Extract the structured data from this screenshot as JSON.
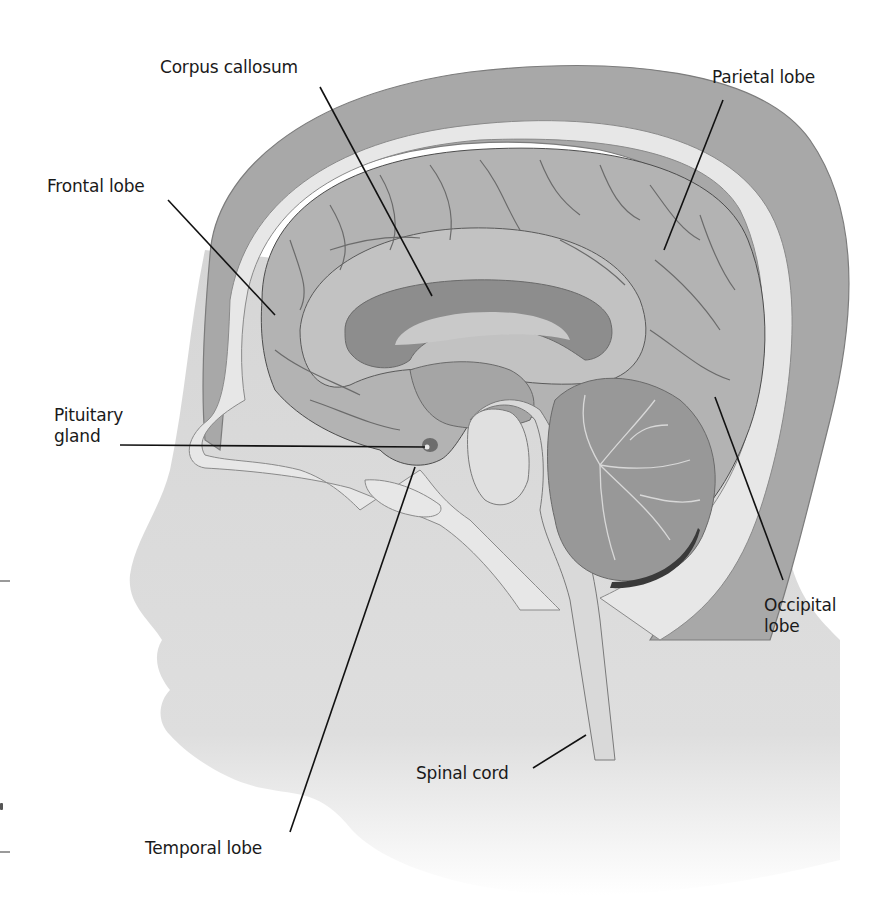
{
  "figure": {
    "colors": {
      "background": "#ffffff",
      "scalp": "#a9a9a9",
      "skull": "#e6e6e6",
      "brain_cortex": "#b4b4b4",
      "brain_medial": "#c4c4c4",
      "corpus_callosum": "#8e8e8e",
      "cerebellum": "#9a9a9a",
      "brainstem": "#dadada",
      "face_skin": "#d8d8d8",
      "sulci_lines": "#6e6e6e",
      "leader_lines": "#111111",
      "label_text": "#1a1a1a"
    }
  },
  "labels": [
    {
      "id": "corpus-callosum",
      "text": "Corpus callosum",
      "x": 160,
      "y": 57
    },
    {
      "id": "parietal-lobe",
      "text": "Parietal lobe",
      "x": 712,
      "y": 67
    },
    {
      "id": "frontal-lobe",
      "text": "Frontal lobe",
      "x": 47,
      "y": 176
    },
    {
      "id": "pituitary-gland",
      "text": "Pituitary\ngland",
      "x": 54,
      "y": 405
    },
    {
      "id": "occipital-lobe",
      "text": "Occipital\nlobe",
      "x": 764,
      "y": 595
    },
    {
      "id": "spinal-cord",
      "text": "Spinal cord",
      "x": 416,
      "y": 763
    },
    {
      "id": "temporal-lobe",
      "text": "Temporal lobe",
      "x": 145,
      "y": 838
    }
  ],
  "leader_lines": [
    {
      "for": "corpus-callosum",
      "x1": 320,
      "y1": 87,
      "x2": 432,
      "y2": 296
    },
    {
      "for": "parietal-lobe",
      "x1": 723,
      "y1": 100,
      "x2": 664,
      "y2": 250
    },
    {
      "for": "frontal-lobe",
      "x1": 168,
      "y1": 200,
      "x2": 275,
      "y2": 315
    },
    {
      "for": "pituitary-gland",
      "x1": 120,
      "y1": 445,
      "x2": 425,
      "y2": 447
    },
    {
      "for": "occipital-lobe",
      "x1": 715,
      "y1": 397,
      "x2": 783,
      "y2": 580
    },
    {
      "for": "spinal-cord",
      "x1": 533,
      "y1": 768,
      "x2": 586,
      "y2": 735
    },
    {
      "for": "temporal-lobe",
      "x1": 290,
      "y1": 832,
      "x2": 415,
      "y2": 467
    }
  ]
}
